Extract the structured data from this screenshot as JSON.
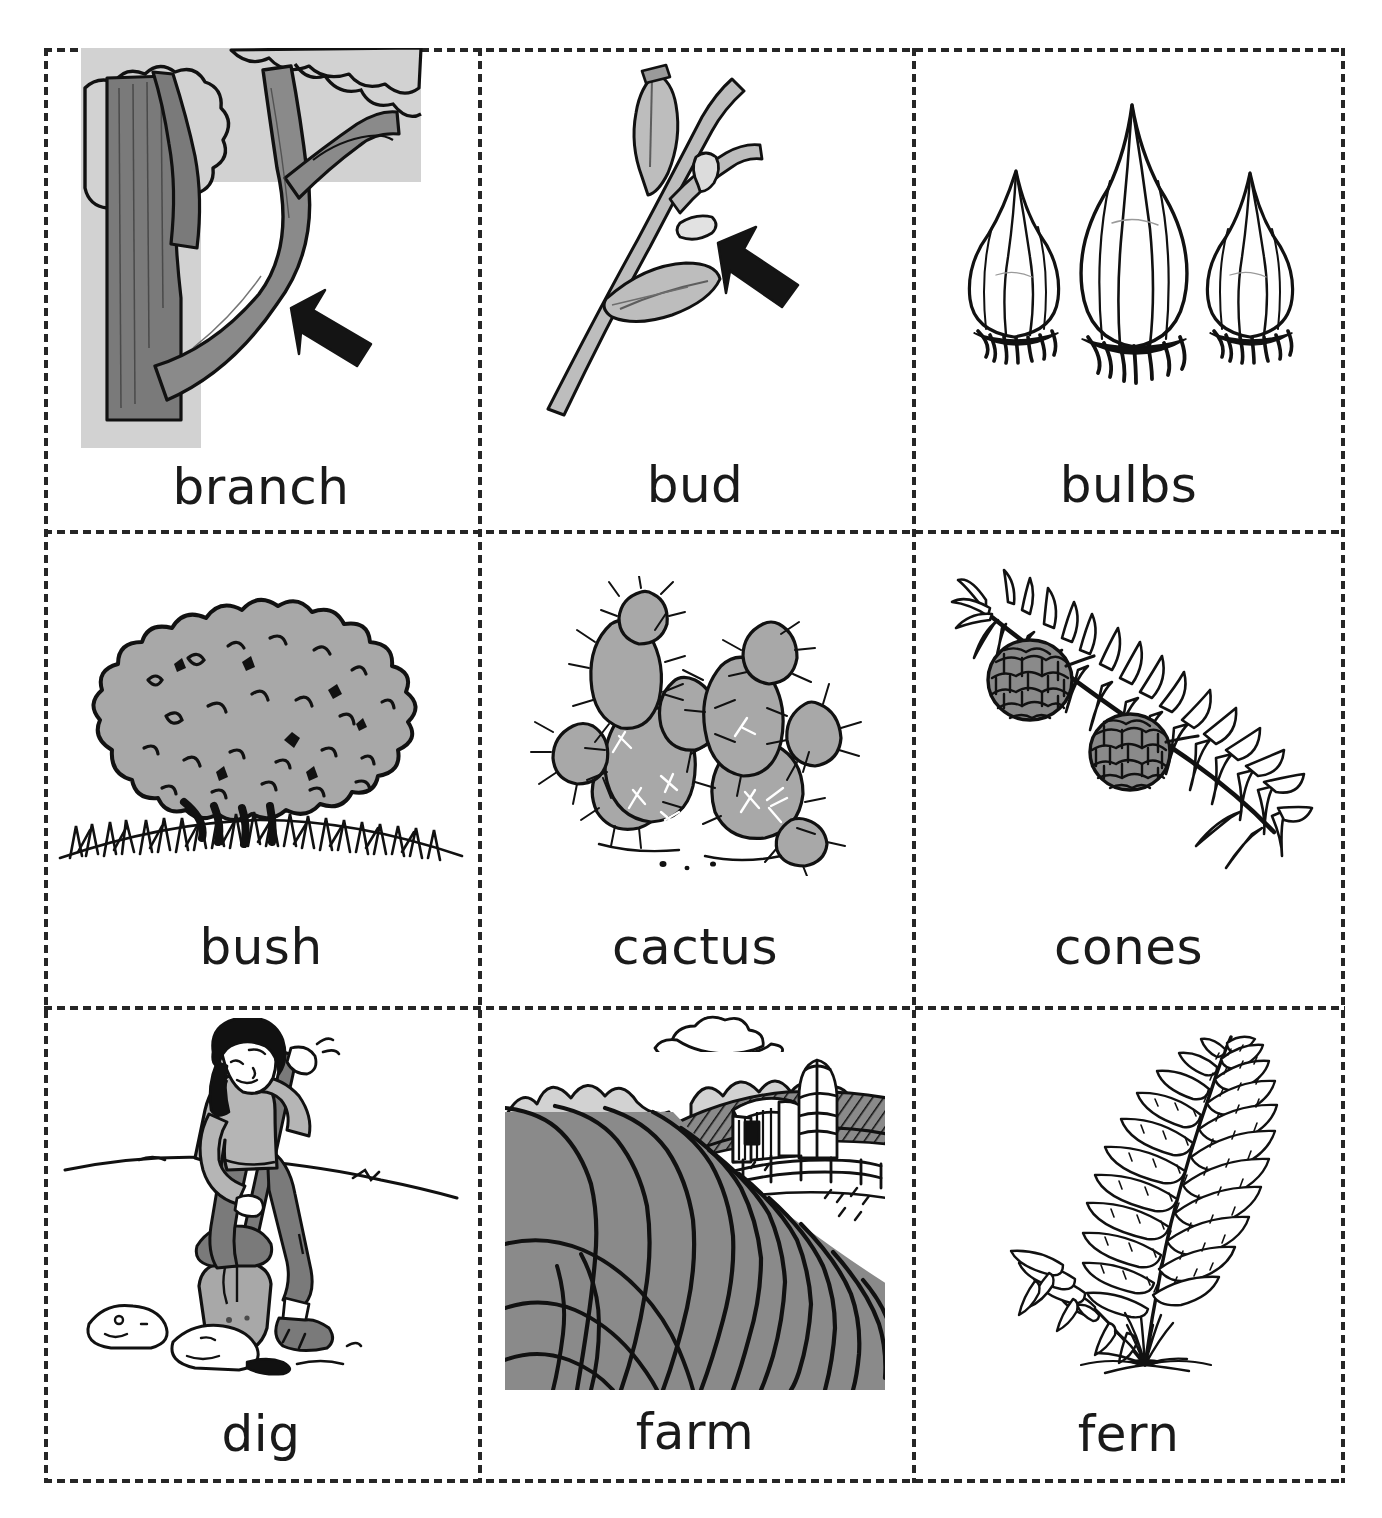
{
  "sheet": {
    "title": "Plant Vocabulary Picture Flashcards",
    "columns": 3,
    "rows": 3,
    "border_style": "dashed-cut-lines"
  },
  "colors": {
    "ink": "#1a1a1a",
    "cut_line": "#262626",
    "light_gray": "#d2d2d2",
    "mid_gray": "#9a9a9a",
    "dark_gray": "#7a7a7a",
    "paper": "#ffffff"
  },
  "cards": [
    {
      "id": "branch",
      "label": "branch",
      "art": "tree-branch-with-arrow",
      "has_arrow": true,
      "background": "light-gray-panel"
    },
    {
      "id": "bud",
      "label": "bud",
      "art": "twig-with-buds-and-arrow",
      "has_arrow": true,
      "background": "white"
    },
    {
      "id": "bulbs",
      "label": "bulbs",
      "art": "three-onion-bulbs",
      "has_arrow": false,
      "background": "white"
    },
    {
      "id": "bush",
      "label": "bush",
      "art": "round-shrub-in-grass",
      "has_arrow": false,
      "background": "white"
    },
    {
      "id": "cactus",
      "label": "cactus",
      "art": "prickly-pear-cactus",
      "has_arrow": false,
      "background": "white"
    },
    {
      "id": "cones",
      "label": "cones",
      "art": "conifer-sprig-with-two-cones",
      "has_arrow": false,
      "background": "white"
    },
    {
      "id": "dig",
      "label": "dig",
      "art": "person-digging-with-shovel",
      "has_arrow": false,
      "background": "white"
    },
    {
      "id": "farm",
      "label": "farm",
      "art": "plowed-field-with-barn-and-silo",
      "has_arrow": false,
      "background": "gray-panel"
    },
    {
      "id": "fern",
      "label": "fern",
      "art": "fern-frond",
      "has_arrow": false,
      "background": "white"
    }
  ]
}
